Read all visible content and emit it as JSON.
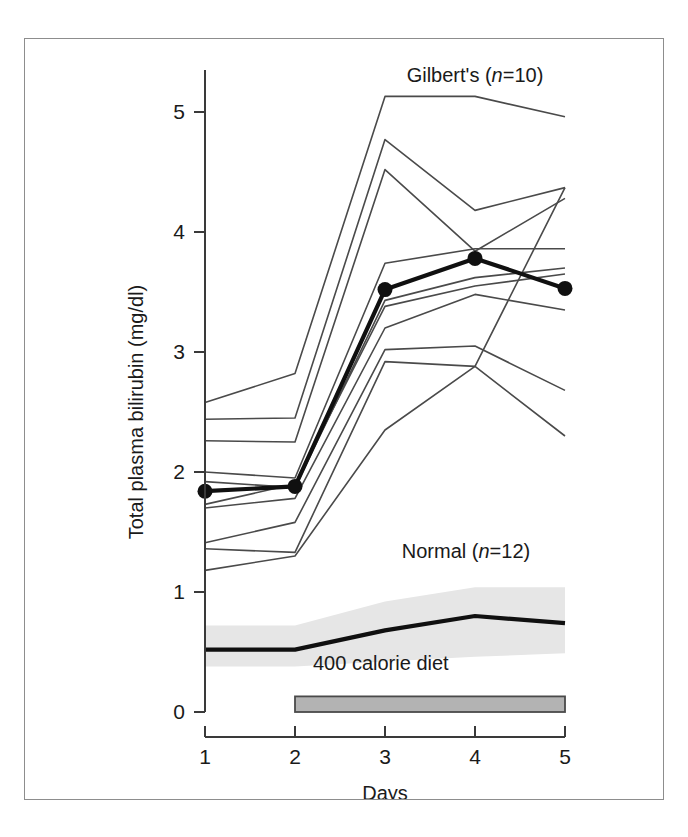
{
  "figure": {
    "background": "#ffffff",
    "frame_color": "#8d8d8d"
  },
  "chart_data": {
    "type": "line",
    "title": "",
    "xlabel": "Days",
    "ylabel": "Total plasma bilirubin (mg/dl)",
    "x": [
      1,
      2,
      3,
      4,
      5
    ],
    "xticklabels": [
      "1",
      "2",
      "3",
      "4",
      "5"
    ],
    "yticklabels": [
      "0",
      "1",
      "2",
      "3",
      "4",
      "5"
    ],
    "yticks": [
      0,
      1,
      2,
      3,
      4,
      5
    ],
    "xlim": [
      1,
      5
    ],
    "ylim": [
      0,
      5.35
    ],
    "grid": false,
    "legend_position": "inline-annotations",
    "annotations": [
      {
        "name": "gilberts-label",
        "text_plain": "Gilbert's (n=10)",
        "text_pre": "Gilbert's (",
        "text_italic": "n",
        "text_post": "=10)",
        "x": 4.0,
        "y": 5.25
      },
      {
        "name": "normal-label",
        "text_plain": "Normal (n=12)",
        "text_pre": "Normal (",
        "text_italic": "n",
        "text_post": "=12)",
        "x": 3.9,
        "y": 1.28
      },
      {
        "name": "diet-bar-label",
        "text_plain": "400 calorie diet",
        "x": 2.2,
        "y": 0.35
      }
    ],
    "diet_bar": {
      "label": "400 calorie diet",
      "x_start": 2,
      "x_end": 5,
      "y": 0,
      "height": 0.13,
      "fill": "#b3b3b3",
      "stroke": "#4a4a4a"
    },
    "series": [
      {
        "name": "gilberts-mean",
        "group": "Gilbert's",
        "kind": "mean-with-markers",
        "color": "#101010",
        "values": [
          1.84,
          1.88,
          3.52,
          3.78,
          3.53
        ]
      },
      {
        "name": "gilberts-subject-1",
        "group": "Gilbert's",
        "kind": "individual",
        "color": "#4a4a4a",
        "values": [
          2.58,
          2.82,
          5.13,
          5.13,
          4.96
        ]
      },
      {
        "name": "gilberts-subject-2",
        "group": "Gilbert's",
        "kind": "individual",
        "color": "#4a4a4a",
        "values": [
          2.44,
          2.45,
          4.77,
          4.18,
          4.37
        ]
      },
      {
        "name": "gilberts-subject-3",
        "group": "Gilbert's",
        "kind": "individual",
        "color": "#4a4a4a",
        "values": [
          2.26,
          2.25,
          4.52,
          3.84,
          4.28
        ]
      },
      {
        "name": "gilberts-subject-4",
        "group": "Gilbert's",
        "kind": "individual",
        "color": "#4a4a4a",
        "values": [
          2.0,
          1.95,
          3.74,
          3.86,
          3.86
        ]
      },
      {
        "name": "gilberts-subject-5",
        "group": "Gilbert's",
        "kind": "individual",
        "color": "#4a4a4a",
        "values": [
          1.92,
          1.87,
          3.43,
          3.62,
          3.7
        ]
      },
      {
        "name": "gilberts-subject-6",
        "group": "Gilbert's",
        "kind": "individual",
        "color": "#4a4a4a",
        "values": [
          1.73,
          1.9,
          3.38,
          3.55,
          3.65
        ]
      },
      {
        "name": "gilberts-subject-7",
        "group": "Gilbert's",
        "kind": "individual",
        "color": "#4a4a4a",
        "values": [
          1.7,
          1.78,
          3.2,
          3.48,
          3.35
        ]
      },
      {
        "name": "gilberts-subject-8",
        "group": "Gilbert's",
        "kind": "individual",
        "color": "#4a4a4a",
        "values": [
          1.41,
          1.58,
          3.02,
          3.05,
          2.68
        ]
      },
      {
        "name": "gilberts-subject-9",
        "group": "Gilbert's",
        "kind": "individual",
        "color": "#4a4a4a",
        "values": [
          1.36,
          1.33,
          2.92,
          2.88,
          2.3
        ]
      },
      {
        "name": "gilberts-subject-10",
        "group": "Gilbert's",
        "kind": "individual",
        "color": "#4a4a4a",
        "values": [
          1.18,
          1.3,
          2.35,
          2.88,
          4.37
        ]
      },
      {
        "name": "normal-mean",
        "group": "Normal",
        "kind": "mean",
        "color": "#101010",
        "values": [
          0.52,
          0.52,
          0.68,
          0.8,
          0.74
        ]
      },
      {
        "name": "normal-band-upper",
        "group": "Normal",
        "kind": "band-upper",
        "color": "#e6e6e6",
        "values": [
          0.72,
          0.72,
          0.92,
          1.04,
          1.04
        ]
      },
      {
        "name": "normal-band-lower",
        "group": "Normal",
        "kind": "band-lower",
        "color": "#e6e6e6",
        "values": [
          0.38,
          0.38,
          0.42,
          0.46,
          0.49
        ]
      }
    ]
  }
}
